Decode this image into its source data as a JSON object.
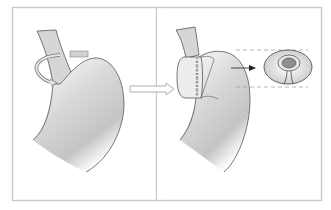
{
  "figure": {
    "type": "medical-procedure-diagram",
    "panels": [
      {
        "id": "before",
        "description": "Stomach with esophagus; gastric fundus wrap direction shown by curved arrow"
      },
      {
        "id": "after",
        "description": "Fundus wrapped around lower esophagus with suture line"
      },
      {
        "id": "cross-section",
        "description": "Cross-section of wrap showing esophagus encircled by fundus"
      }
    ],
    "arrows": [
      {
        "type": "hollow",
        "meaning": "transition from before to after"
      },
      {
        "type": "solid",
        "meaning": "points to cross-section detail"
      },
      {
        "type": "curved",
        "meaning": "wrap rotation around esophagus"
      }
    ],
    "colors": {
      "frame": "#c8c8c8",
      "outline": "#555555",
      "fill_light": "#f4f4f4",
      "fill_shade": "#bdbdbd",
      "esophagus": "#d6d6d6",
      "dashed": "#9a9a9a"
    }
  }
}
